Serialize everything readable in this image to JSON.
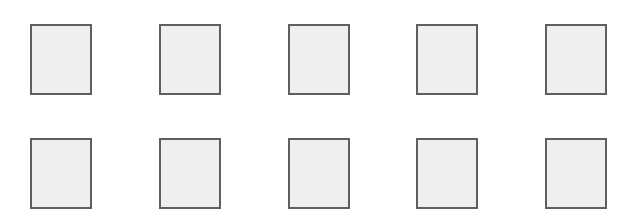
{
  "grid": {
    "rows": 2,
    "columns": 5,
    "tile_fill_color": "#efefef",
    "tile_border_color": "#5f5f5f",
    "background_color": "#ffffff",
    "tiles": [
      {
        "row": 1,
        "col": 1,
        "x": 30,
        "y": 24
      },
      {
        "row": 1,
        "col": 2,
        "x": 159,
        "y": 24
      },
      {
        "row": 1,
        "col": 3,
        "x": 288,
        "y": 24
      },
      {
        "row": 1,
        "col": 4,
        "x": 416,
        "y": 24
      },
      {
        "row": 1,
        "col": 5,
        "x": 545,
        "y": 24
      },
      {
        "row": 2,
        "col": 1,
        "x": 30,
        "y": 138
      },
      {
        "row": 2,
        "col": 2,
        "x": 159,
        "y": 138
      },
      {
        "row": 2,
        "col": 3,
        "x": 288,
        "y": 138
      },
      {
        "row": 2,
        "col": 4,
        "x": 416,
        "y": 138
      },
      {
        "row": 2,
        "col": 5,
        "x": 545,
        "y": 138
      }
    ]
  }
}
